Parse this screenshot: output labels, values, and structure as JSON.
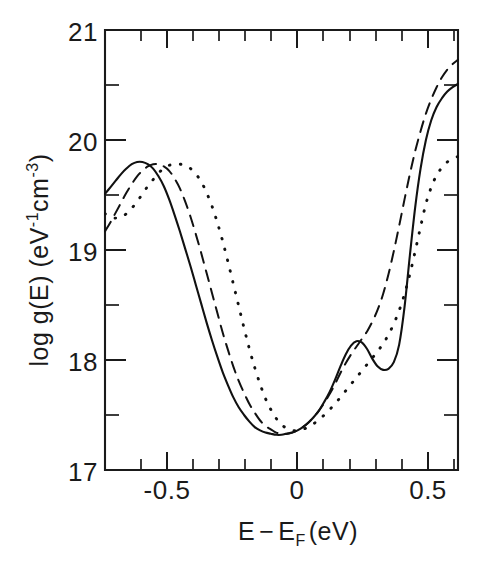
{
  "figure": {
    "background_color": "#ffffff",
    "ink_color": "#111111"
  },
  "chart_data": {
    "type": "line",
    "title": "",
    "subtitle": "",
    "xlabel": "E−E_F (eV)",
    "xlabel_parts": {
      "lead": "E",
      "minus": "−",
      "ef_base": "E",
      "ef_sub": "F",
      "units": "(eV)"
    },
    "ylabel": "log g(E) (eV⁻¹cm⁻³)",
    "ylabel_parts": {
      "lead": "log  g(E)  (eV",
      "sup1": "-1",
      "mid": "cm",
      "sup2": "-3",
      "close": ")"
    },
    "xlim": [
      -0.7,
      0.62
    ],
    "ylim": [
      17,
      21
    ],
    "grid": false,
    "legend": null,
    "legend_position": "none",
    "x_major_ticks": [
      -0.5,
      0,
      0.5
    ],
    "x_major_tick_labels": [
      "-0.5",
      "0",
      "0.5"
    ],
    "x_minor_tick_step": 0.1,
    "x_minor_ticks": [
      -0.7,
      -0.6,
      -0.4,
      -0.3,
      -0.2,
      -0.1,
      0.1,
      0.2,
      0.3,
      0.4,
      0.6
    ],
    "y_major_ticks": [
      17,
      18,
      19,
      20,
      21
    ],
    "y_major_tick_labels": [
      "17",
      "18",
      "19",
      "20",
      "21"
    ],
    "y_minor_ticks": [
      17.5,
      18.5,
      19.5,
      20.5
    ],
    "axis_frame": "box",
    "tick_direction": "in",
    "series": [
      {
        "name": "solid",
        "line_style": "solid",
        "x": [
          -0.7,
          -0.68,
          -0.66,
          -0.64,
          -0.62,
          -0.6,
          -0.58,
          -0.56,
          -0.54,
          -0.52,
          -0.5,
          -0.48,
          -0.46,
          -0.44,
          -0.42,
          -0.4,
          -0.38,
          -0.36,
          -0.34,
          -0.32,
          -0.3,
          -0.28,
          -0.26,
          -0.24,
          -0.22,
          -0.2,
          -0.18,
          -0.16,
          -0.14,
          -0.12,
          -0.1,
          -0.08,
          -0.06,
          -0.04,
          -0.02,
          0.0,
          0.02,
          0.04,
          0.06,
          0.08,
          0.1,
          0.12,
          0.14,
          0.16,
          0.18,
          0.2,
          0.22,
          0.24,
          0.26,
          0.28,
          0.3,
          0.32,
          0.34,
          0.36,
          0.38,
          0.4,
          0.42,
          0.44,
          0.46,
          0.48,
          0.5,
          0.52,
          0.54,
          0.56,
          0.58,
          0.6,
          0.62
        ],
        "y": [
          19.51,
          19.57,
          19.63,
          19.69,
          19.74,
          19.78,
          19.8,
          19.8,
          19.78,
          19.74,
          19.67,
          19.58,
          19.46,
          19.32,
          19.17,
          19.01,
          18.85,
          18.68,
          18.51,
          18.34,
          18.18,
          18.03,
          17.89,
          17.77,
          17.66,
          17.57,
          17.5,
          17.44,
          17.39,
          17.36,
          17.34,
          17.33,
          17.32,
          17.32,
          17.33,
          17.34,
          17.36,
          17.39,
          17.43,
          17.48,
          17.54,
          17.62,
          17.71,
          17.82,
          17.94,
          18.05,
          18.13,
          18.17,
          18.16,
          18.1,
          18.01,
          17.94,
          17.91,
          17.92,
          17.98,
          18.14,
          18.48,
          18.95,
          19.39,
          19.74,
          20.0,
          20.18,
          20.3,
          20.38,
          20.44,
          20.48,
          20.51
        ]
      },
      {
        "name": "dashed",
        "line_style": "dashed",
        "x": [
          -0.7,
          -0.68,
          -0.66,
          -0.64,
          -0.62,
          -0.6,
          -0.58,
          -0.56,
          -0.54,
          -0.52,
          -0.5,
          -0.48,
          -0.46,
          -0.44,
          -0.42,
          -0.4,
          -0.38,
          -0.36,
          -0.34,
          -0.32,
          -0.3,
          -0.28,
          -0.26,
          -0.24,
          -0.22,
          -0.2,
          -0.18,
          -0.16,
          -0.14,
          -0.12,
          -0.1,
          -0.08,
          -0.06,
          -0.04,
          -0.02,
          0.0,
          0.02,
          0.04,
          0.06,
          0.08,
          0.1,
          0.12,
          0.14,
          0.16,
          0.18,
          0.2,
          0.22,
          0.24,
          0.26,
          0.28,
          0.3,
          0.32,
          0.34,
          0.36,
          0.38,
          0.4,
          0.42,
          0.44,
          0.46,
          0.48,
          0.5,
          0.52,
          0.54,
          0.56,
          0.58,
          0.6,
          0.62
        ],
        "y": [
          19.17,
          19.25,
          19.34,
          19.43,
          19.52,
          19.6,
          19.67,
          19.72,
          19.76,
          19.78,
          19.78,
          19.76,
          19.72,
          19.65,
          19.56,
          19.44,
          19.3,
          19.14,
          18.97,
          18.79,
          18.61,
          18.43,
          18.25,
          18.09,
          17.94,
          17.81,
          17.7,
          17.6,
          17.52,
          17.45,
          17.4,
          17.37,
          17.34,
          17.33,
          17.33,
          17.34,
          17.36,
          17.39,
          17.43,
          17.48,
          17.54,
          17.61,
          17.69,
          17.78,
          17.88,
          17.97,
          18.05,
          18.12,
          18.19,
          18.26,
          18.35,
          18.46,
          18.6,
          18.78,
          18.99,
          19.22,
          19.46,
          19.69,
          19.9,
          20.08,
          20.24,
          20.37,
          20.48,
          20.57,
          20.64,
          20.69,
          20.73
        ]
      },
      {
        "name": "dotted",
        "line_style": "dotted",
        "x": [
          -0.7,
          -0.68,
          -0.66,
          -0.64,
          -0.62,
          -0.6,
          -0.58,
          -0.56,
          -0.54,
          -0.52,
          -0.5,
          -0.48,
          -0.46,
          -0.44,
          -0.42,
          -0.4,
          -0.38,
          -0.36,
          -0.34,
          -0.32,
          -0.3,
          -0.28,
          -0.26,
          -0.24,
          -0.22,
          -0.2,
          -0.18,
          -0.16,
          -0.14,
          -0.12,
          -0.1,
          -0.08,
          -0.06,
          -0.04,
          -0.02,
          0.0,
          0.02,
          0.04,
          0.06,
          0.08,
          0.1,
          0.12,
          0.14,
          0.16,
          0.18,
          0.2,
          0.22,
          0.24,
          0.26,
          0.28,
          0.3,
          0.32,
          0.34,
          0.36,
          0.38,
          0.4,
          0.42,
          0.44,
          0.46,
          0.48,
          0.5,
          0.52,
          0.54,
          0.56,
          0.58,
          0.6,
          0.62
        ],
        "y": [
          19.33,
          19.3,
          19.29,
          19.3,
          19.33,
          19.38,
          19.44,
          19.51,
          19.58,
          19.64,
          19.7,
          19.74,
          19.77,
          19.78,
          19.78,
          19.77,
          19.74,
          19.69,
          19.62,
          19.52,
          19.4,
          19.25,
          19.08,
          18.89,
          18.69,
          18.49,
          18.29,
          18.1,
          17.93,
          17.78,
          17.65,
          17.55,
          17.47,
          17.41,
          17.38,
          17.36,
          17.36,
          17.37,
          17.39,
          17.42,
          17.46,
          17.5,
          17.55,
          17.6,
          17.66,
          17.72,
          17.78,
          17.84,
          17.9,
          17.96,
          18.02,
          18.08,
          18.15,
          18.23,
          18.33,
          18.45,
          18.6,
          18.78,
          18.99,
          19.21,
          19.42,
          19.57,
          19.68,
          19.75,
          19.8,
          19.83,
          19.85
        ]
      }
    ]
  },
  "axes": {
    "x_tick_labels": [
      "-0.5",
      "0",
      "0.5"
    ],
    "y_tick_labels": [
      "17",
      "18",
      "19",
      "20",
      "21"
    ]
  }
}
